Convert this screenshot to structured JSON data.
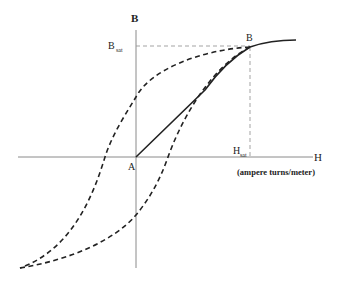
{
  "diagram": {
    "type": "B-H hysteresis loop",
    "axes": {
      "y_label": "B",
      "x_label": "H",
      "x_units": "(ampere turns/meter)"
    },
    "markers": {
      "b_sat": "B",
      "b_sat_sub": "sat",
      "h_sat": "H",
      "h_sat_sub": "sat",
      "origin": "A",
      "saturation_point": "B"
    },
    "curves": [
      {
        "name": "initial-magnetization",
        "style": "solid",
        "from": "A",
        "to": "B"
      },
      {
        "name": "descending-branch",
        "style": "dashed"
      },
      {
        "name": "ascending-branch",
        "style": "dashed"
      },
      {
        "name": "saturation-extension",
        "style": "solid"
      }
    ],
    "colors": {
      "ink": "#222222",
      "axis": "#888888",
      "guide": "#999999"
    }
  }
}
